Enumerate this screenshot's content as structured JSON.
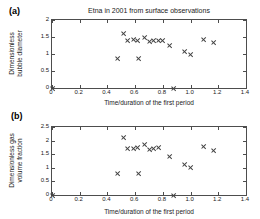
{
  "figure": {
    "panel_a_tag": "(a)",
    "panel_b_tag": "(b)"
  },
  "chart_data": [
    {
      "type": "scatter",
      "panel": "(a)",
      "title": "Etna  in 2001 from surface observations",
      "xlabel": "Time/duration of the first period",
      "ylabel": "Dimensionless bubble diameter",
      "ylabel_line1": "Dimensionless",
      "ylabel_line2": "bubble diameter",
      "xlim": [
        0,
        1.4
      ],
      "ylim": [
        0,
        2
      ],
      "xticks": [
        0,
        0.2,
        0.4,
        0.6,
        0.8,
        1.0,
        1.2,
        1.4
      ],
      "xticklabels": [
        "0",
        "0.2",
        "0.4",
        "0.6",
        "0.8",
        "1.0",
        "1.2",
        "1.4"
      ],
      "yticks": [
        0,
        0.5,
        1,
        1.5,
        2
      ],
      "yticklabels": [
        "0",
        "0.5",
        "1",
        "1.5",
        "2"
      ],
      "grid": false,
      "legend": "none",
      "marker": "x",
      "marker_color": "#404040",
      "points": [
        {
          "x": 0.0,
          "y": 0.0
        },
        {
          "x": 0.475,
          "y": 0.88
        },
        {
          "x": 0.515,
          "y": 1.59
        },
        {
          "x": 0.545,
          "y": 1.39
        },
        {
          "x": 0.585,
          "y": 1.42
        },
        {
          "x": 0.62,
          "y": 1.41
        },
        {
          "x": 0.625,
          "y": 0.87
        },
        {
          "x": 0.665,
          "y": 1.48
        },
        {
          "x": 0.7,
          "y": 1.37
        },
        {
          "x": 0.735,
          "y": 1.41
        },
        {
          "x": 0.765,
          "y": 1.41
        },
        {
          "x": 0.8,
          "y": 1.4
        },
        {
          "x": 0.845,
          "y": 1.25
        },
        {
          "x": 0.875,
          "y": 0.0
        },
        {
          "x": 0.955,
          "y": 1.08
        },
        {
          "x": 1.0,
          "y": 1.0
        },
        {
          "x": 1.095,
          "y": 1.42
        },
        {
          "x": 1.165,
          "y": 1.35
        }
      ]
    },
    {
      "type": "scatter",
      "panel": "(b)",
      "title": "",
      "xlabel": "Time/duration of the first period",
      "ylabel": "Dimensionless gas volume fraction",
      "ylabel_line1": "Dimensionless gas",
      "ylabel_line2": "volume fraction",
      "xlim": [
        0,
        1.4
      ],
      "ylim": [
        0,
        2.5
      ],
      "xticks": [
        0,
        0.2,
        0.4,
        0.6,
        0.8,
        1.0,
        1.2,
        1.4
      ],
      "xticklabels": [
        "0",
        "0.2",
        "0.4",
        "0.6",
        "0.8",
        "1.0",
        "1.2",
        "1.4"
      ],
      "yticks": [
        0,
        0.5,
        1,
        1.5,
        2,
        2.5
      ],
      "yticklabels": [
        "0",
        "0.5",
        "1",
        "1.5",
        "2",
        "2.5"
      ],
      "grid": false,
      "legend": "none",
      "marker": "x",
      "marker_color": "#404040",
      "points": [
        {
          "x": 0.0,
          "y": 0.0
        },
        {
          "x": 0.475,
          "y": 0.8
        },
        {
          "x": 0.515,
          "y": 2.13
        },
        {
          "x": 0.545,
          "y": 1.7
        },
        {
          "x": 0.585,
          "y": 1.72
        },
        {
          "x": 0.62,
          "y": 1.74
        },
        {
          "x": 0.625,
          "y": 0.79
        },
        {
          "x": 0.665,
          "y": 1.87
        },
        {
          "x": 0.7,
          "y": 1.66
        },
        {
          "x": 0.735,
          "y": 1.72
        },
        {
          "x": 0.765,
          "y": 1.75
        },
        {
          "x": 0.845,
          "y": 1.43
        },
        {
          "x": 0.875,
          "y": 0.0
        },
        {
          "x": 0.955,
          "y": 1.13
        },
        {
          "x": 1.0,
          "y": 1.0
        },
        {
          "x": 1.095,
          "y": 1.79
        },
        {
          "x": 1.165,
          "y": 1.64
        }
      ]
    }
  ]
}
